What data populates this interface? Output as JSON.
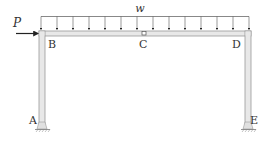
{
  "diagram": {
    "type": "portal-frame",
    "labels": {
      "P": "P",
      "w": "w",
      "A": "A",
      "B": "B",
      "C": "C",
      "D": "D",
      "E": "E"
    },
    "distributed_load": {
      "label": "w",
      "arrow_count": 14,
      "direction": "down"
    },
    "point_load": {
      "label": "P",
      "direction": "right",
      "applied_at": "B"
    },
    "hinge": {
      "label": "C"
    },
    "supports": [
      {
        "label": "A",
        "type": "fixed"
      },
      {
        "label": "E",
        "type": "fixed"
      }
    ],
    "colors": {
      "member_fill": "#e8e8e8",
      "member_edge": "#9a9a9a",
      "load_line": "#6a6a6a",
      "arrow": "#222222",
      "text": "#333333"
    }
  }
}
